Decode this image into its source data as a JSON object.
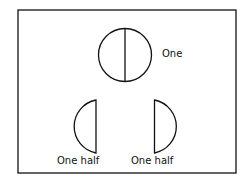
{
  "diagram": {
    "whole_label": "One",
    "left_half_label": "One half",
    "right_half_label": "One half",
    "stroke_color": "#111111",
    "background": "#ffffff"
  }
}
